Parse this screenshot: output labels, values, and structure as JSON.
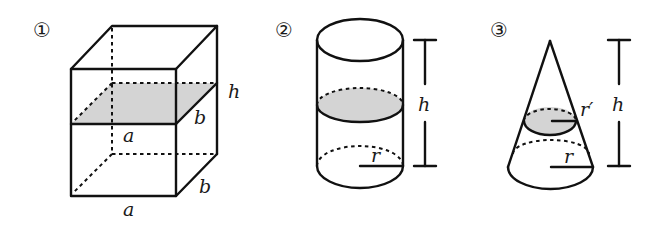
{
  "figures": [
    {
      "number": "①",
      "shape": "rectangular prism",
      "labels": {
        "height": "h",
        "width_top": "a",
        "depth_top": "b",
        "width_bottom": "a",
        "depth_bottom": "b"
      },
      "cross_section": "shaded rectangle parallel to base"
    },
    {
      "number": "②",
      "shape": "cylinder",
      "labels": {
        "height": "h",
        "radius": "r"
      },
      "cross_section": "shaded circle parallel to base"
    },
    {
      "number": "③",
      "shape": "cone",
      "labels": {
        "height": "h",
        "radius": "r",
        "section_radius": "r′"
      },
      "cross_section": "shaded circle parallel to base"
    }
  ],
  "colors": {
    "line": "#111111",
    "shade": "#d4d4d4",
    "background": "#ffffff"
  }
}
